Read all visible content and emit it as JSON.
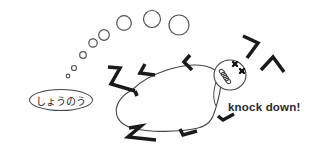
{
  "illustration": {
    "thought_label": "しょうのう",
    "caption": "knock down!",
    "colors": {
      "line": "#333333",
      "limb": "#1a1a1a",
      "background": "#ffffff"
    },
    "thought_bubbles": [
      {
        "cx": 68,
        "cy": 76,
        "r": 1.8
      },
      {
        "cx": 74,
        "cy": 68,
        "r": 2.5
      },
      {
        "cx": 83,
        "cy": 55,
        "r": 3.3
      },
      {
        "cx": 93,
        "cy": 43,
        "r": 4.2
      },
      {
        "cx": 104,
        "cy": 35,
        "r": 5.3
      },
      {
        "cx": 124,
        "cy": 23,
        "r": 7.3
      },
      {
        "cx": 152,
        "cy": 19,
        "r": 8.5
      },
      {
        "cx": 179,
        "cy": 25,
        "r": 10
      }
    ]
  }
}
